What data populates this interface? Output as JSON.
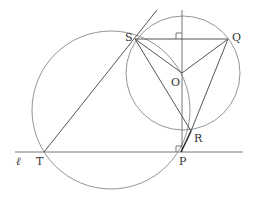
{
  "diagram": {
    "type": "geometry",
    "colors": {
      "line": "#555555",
      "circle": "#777777",
      "bold_arc": "#333333",
      "label": "#333333"
    },
    "labels": {
      "S": "S",
      "Q": "Q",
      "O": "O",
      "R": "R",
      "P": "P",
      "T": "T",
      "line_l": "ℓ"
    },
    "points": {
      "S": [
        135,
        39
      ],
      "Q": [
        228,
        39
      ],
      "O": [
        182,
        73
      ],
      "R": [
        191,
        131
      ],
      "P": [
        181,
        152
      ],
      "T": [
        44,
        152
      ]
    },
    "circles": [
      {
        "name": "small-circle",
        "center": [
          183,
          73
        ],
        "radius": 57
      },
      {
        "name": "large-circle",
        "center": [
          111,
          110
        ],
        "radius": 79
      }
    ],
    "right_angle_marks": [
      "SQ-vertical",
      "line-l-vertical"
    ]
  }
}
